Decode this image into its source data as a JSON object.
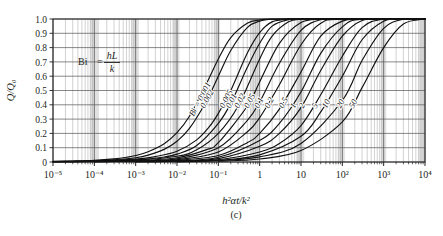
{
  "figure": {
    "panel_label": "(c)",
    "annotation": {
      "name": "Bi",
      "equals": "=",
      "numerator": "hL",
      "denominator": "k"
    }
  },
  "chart_data": {
    "type": "line",
    "title": "",
    "subtitle": "",
    "panel": "(c)",
    "xlabel": "h²αt/k²",
    "ylabel": "Q/Q₀",
    "xscale": "log",
    "yscale": "linear",
    "xlim": [
      1e-05,
      10000
    ],
    "ylim": [
      0,
      1.0
    ],
    "grid": true,
    "minor_grid": true,
    "legend": "inline-curve-labels",
    "xticklabels": [
      "10⁻⁵",
      "10⁻⁴",
      "10⁻³",
      "10⁻²",
      "10⁻¹",
      "1",
      "10",
      "10²",
      "10³",
      "10⁴"
    ],
    "xtickvalues": [
      1e-05,
      0.0001,
      0.001,
      0.01,
      0.1,
      1,
      10,
      100,
      1000,
      10000
    ],
    "yticklabels": [
      "0",
      "0.1",
      "0.2",
      "0.3",
      "0.4",
      "0.5",
      "0.6",
      "0.7",
      "0.8",
      "0.9",
      "1.0"
    ],
    "ytickvalues": [
      0,
      0.1,
      0.2,
      0.3,
      0.4,
      0.5,
      0.6,
      0.7,
      0.8,
      0.9,
      1.0
    ],
    "annotation_text": "Bi = hL/k",
    "series": [
      {
        "name": "Bi = 0.001",
        "label": "Bi = 0.001",
        "bi": 0.001,
        "x50": 0.0011,
        "points": [
          [
            1e-05,
            0.004
          ],
          [
            3e-05,
            0.007
          ],
          [
            0.0001,
            0.012
          ],
          [
            0.0003,
            0.022
          ],
          [
            0.0006,
            0.033
          ],
          [
            0.001,
            0.045
          ],
          [
            0.002,
            0.072
          ],
          [
            0.005,
            0.13
          ],
          [
            0.01,
            0.205
          ],
          [
            0.02,
            0.32
          ],
          [
            0.05,
            0.54
          ],
          [
            0.1,
            0.72
          ],
          [
            0.2,
            0.87
          ],
          [
            0.5,
            0.97
          ],
          [
            1,
            0.993
          ],
          [
            2,
            0.999
          ],
          [
            10.0,
            1.0
          ],
          [
            10000.0,
            1.0
          ]
        ]
      },
      {
        "name": "Bi = 0.002",
        "label": "0.002",
        "bi": 0.002,
        "x50": 0.0022,
        "points": [
          [
            1e-05,
            0.003
          ],
          [
            0.0001,
            0.009
          ],
          [
            0.0003,
            0.016
          ],
          [
            0.001,
            0.03
          ],
          [
            0.002,
            0.048
          ],
          [
            0.005,
            0.09
          ],
          [
            0.01,
            0.145
          ],
          [
            0.02,
            0.235
          ],
          [
            0.05,
            0.42
          ],
          [
            0.1,
            0.6
          ],
          [
            0.2,
            0.78
          ],
          [
            0.5,
            0.94
          ],
          [
            1,
            0.985
          ],
          [
            2,
            0.998
          ],
          [
            10.0,
            1.0
          ],
          [
            10000.0,
            1.0
          ]
        ]
      },
      {
        "name": "Bi = 0.005",
        "label": "0.005",
        "bi": 0.005,
        "x50": 0.0055,
        "points": [
          [
            1e-05,
            0.002
          ],
          [
            0.0001,
            0.006
          ],
          [
            0.001,
            0.02
          ],
          [
            0.003,
            0.038
          ],
          [
            0.01,
            0.075
          ],
          [
            0.03,
            0.155
          ],
          [
            0.06,
            0.245
          ],
          [
            0.1,
            0.34
          ],
          [
            0.2,
            0.5
          ],
          [
            0.5,
            0.76
          ],
          [
            1,
            0.905
          ],
          [
            2,
            0.98
          ],
          [
            5,
            0.999
          ],
          [
            10.0,
            1.0
          ],
          [
            10000.0,
            1.0
          ]
        ]
      },
      {
        "name": "Bi = 0.01",
        "label": "0.01",
        "bi": 0.01,
        "x50": 0.012,
        "points": [
          [
            1e-05,
            0.0015
          ],
          [
            0.0001,
            0.005
          ],
          [
            0.001,
            0.015
          ],
          [
            0.005,
            0.035
          ],
          [
            0.01,
            0.055
          ],
          [
            0.03,
            0.115
          ],
          [
            0.1,
            0.27
          ],
          [
            0.2,
            0.41
          ],
          [
            0.5,
            0.66
          ],
          [
            1,
            0.83
          ],
          [
            2,
            0.95
          ],
          [
            5,
            0.996
          ],
          [
            10.0,
            1.0
          ],
          [
            10000.0,
            1.0
          ]
        ]
      },
      {
        "name": "Bi = 0.02",
        "label": "0.02",
        "bi": 0.02,
        "x50": 0.025,
        "points": [
          [
            1e-05,
            0.001
          ],
          [
            0.0001,
            0.004
          ],
          [
            0.001,
            0.012
          ],
          [
            0.01,
            0.04
          ],
          [
            0.03,
            0.085
          ],
          [
            0.1,
            0.2
          ],
          [
            0.3,
            0.39
          ],
          [
            1,
            0.72
          ],
          [
            2,
            0.88
          ],
          [
            5,
            0.98
          ],
          [
            10.0,
            0.998
          ],
          [
            20.0,
            1.0
          ],
          [
            10000.0,
            1.0
          ]
        ]
      },
      {
        "name": "Bi = 0.05",
        "label": "0.05",
        "bi": 0.05,
        "x50": 0.06,
        "points": [
          [
            0.0001,
            0.003
          ],
          [
            0.001,
            0.009
          ],
          [
            0.01,
            0.03
          ],
          [
            0.05,
            0.085
          ],
          [
            0.1,
            0.135
          ],
          [
            0.5,
            0.39
          ],
          [
            1,
            0.56
          ],
          [
            3,
            0.83
          ],
          [
            10.0,
            0.975
          ],
          [
            30.0,
            0.999
          ],
          [
            100.0,
            1.0
          ],
          [
            10000.0,
            1.0
          ]
        ]
      },
      {
        "name": "Bi = 0.1",
        "label": "0.1",
        "bi": 0.1,
        "x50": 0.12,
        "points": [
          [
            0.0001,
            0.002
          ],
          [
            0.001,
            0.007
          ],
          [
            0.01,
            0.022
          ],
          [
            0.1,
            0.1
          ],
          [
            0.5,
            0.29
          ],
          [
            1,
            0.42
          ],
          [
            3,
            0.69
          ],
          [
            10.0,
            0.92
          ],
          [
            30.0,
            0.995
          ],
          [
            100.0,
            1.0
          ],
          [
            10000.0,
            1.0
          ]
        ]
      },
      {
        "name": "Bi = 0.2",
        "label": "0.2",
        "bi": 0.2,
        "x50": 0.27,
        "points": [
          [
            0.0001,
            0.0015
          ],
          [
            0.001,
            0.005
          ],
          [
            0.01,
            0.016
          ],
          [
            0.1,
            0.07
          ],
          [
            0.5,
            0.21
          ],
          [
            1,
            0.31
          ],
          [
            3,
            0.54
          ],
          [
            10.0,
            0.82
          ],
          [
            30.0,
            0.97
          ],
          [
            100.0,
            0.999
          ],
          [
            10000.0,
            1.0
          ]
        ]
      },
      {
        "name": "Bi = 0.5",
        "label": "0.5",
        "bi": 0.5,
        "x50": 0.75,
        "points": [
          [
            0.001,
            0.003
          ],
          [
            0.01,
            0.011
          ],
          [
            0.1,
            0.045
          ],
          [
            0.5,
            0.135
          ],
          [
            1,
            0.2
          ],
          [
            3,
            0.37
          ],
          [
            10.0,
            0.63
          ],
          [
            30.0,
            0.88
          ],
          [
            100.0,
            0.985
          ],
          [
            300.0,
            1.0
          ],
          [
            10000.0,
            1.0
          ]
        ]
      },
      {
        "name": "Bi = 1",
        "label": "1",
        "bi": 1,
        "x50": 1.6,
        "points": [
          [
            0.001,
            0.002
          ],
          [
            0.01,
            0.008
          ],
          [
            0.1,
            0.033
          ],
          [
            1,
            0.15
          ],
          [
            3,
            0.27
          ],
          [
            10.0,
            0.49
          ],
          [
            30.0,
            0.76
          ],
          [
            100.0,
            0.945
          ],
          [
            300.0,
            0.998
          ],
          [
            10000.0,
            1.0
          ]
        ]
      },
      {
        "name": "Bi = 2",
        "label": "2",
        "bi": 2,
        "x50": 2.8,
        "points": [
          [
            0.001,
            0.0015
          ],
          [
            0.01,
            0.006
          ],
          [
            0.1,
            0.024
          ],
          [
            1,
            0.11
          ],
          [
            3,
            0.2
          ],
          [
            10.0,
            0.38
          ],
          [
            30.0,
            0.64
          ],
          [
            100.0,
            0.88
          ],
          [
            300.0,
            0.99
          ],
          [
            1000.0,
            1.0
          ],
          [
            10000.0,
            1.0
          ]
        ]
      },
      {
        "name": "Bi = 5",
        "label": "5",
        "bi": 5,
        "x50": 7.5,
        "points": [
          [
            0.01,
            0.004
          ],
          [
            0.1,
            0.016
          ],
          [
            1,
            0.07
          ],
          [
            3,
            0.13
          ],
          [
            10.0,
            0.255
          ],
          [
            30.0,
            0.47
          ],
          [
            100.0,
            0.74
          ],
          [
            300.0,
            0.94
          ],
          [
            1000.0,
            0.998
          ],
          [
            10000.0,
            1.0
          ]
        ]
      },
      {
        "name": "Bi = 10",
        "label": "10",
        "bi": 10,
        "x50": 17,
        "points": [
          [
            0.01,
            0.003
          ],
          [
            0.1,
            0.012
          ],
          [
            1,
            0.05
          ],
          [
            10.0,
            0.18
          ],
          [
            30.0,
            0.35
          ],
          [
            100.0,
            0.6
          ],
          [
            300.0,
            0.855
          ],
          [
            1000.0,
            0.985
          ],
          [
            3000.0,
            1.0
          ],
          [
            10000.0,
            1.0
          ]
        ]
      },
      {
        "name": "Bi = 20",
        "label": "20",
        "bi": 20,
        "x50": 42,
        "points": [
          [
            0.01,
            0.002
          ],
          [
            0.1,
            0.009
          ],
          [
            1,
            0.036
          ],
          [
            10.0,
            0.13
          ],
          [
            100.0,
            0.43
          ],
          [
            300.0,
            0.71
          ],
          [
            1000.0,
            0.935
          ],
          [
            3000.0,
            0.998
          ],
          [
            10000.0,
            1.0
          ]
        ]
      },
      {
        "name": "Bi = 50",
        "label": "50",
        "bi": 50,
        "x50": 230,
        "points": [
          [
            0.1,
            0.005
          ],
          [
            1,
            0.021
          ],
          [
            10.0,
            0.08
          ],
          [
            100.0,
            0.28
          ],
          [
            300.0,
            0.52
          ],
          [
            1000.0,
            0.8
          ],
          [
            3000.0,
            0.965
          ],
          [
            10000.0,
            1.0
          ]
        ]
      }
    ]
  }
}
